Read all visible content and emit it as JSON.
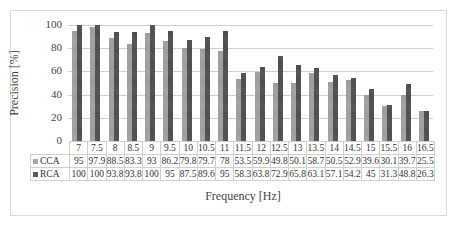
{
  "chart_data": {
    "type": "bar",
    "title": "",
    "xlabel": "Frequency [Hz]",
    "ylabel": "Precision [%]",
    "ylim": [
      0,
      100
    ],
    "yticks": [
      0,
      20,
      40,
      60,
      80,
      100
    ],
    "grid": true,
    "legend_position": "data-table",
    "categories": [
      "7",
      "7.5",
      "8",
      "8.5",
      "9",
      "9.5",
      "10",
      "10.5",
      "11",
      "11.5",
      "12",
      "12.5",
      "13",
      "13.5",
      "14",
      "14.5",
      "15",
      "15.5",
      "16",
      "16.5"
    ],
    "series": [
      {
        "name": "CCA",
        "color": "#a6a6a6",
        "values": [
          95,
          97.9,
          88.5,
          83.3,
          93,
          86.2,
          79.8,
          79.7,
          78,
          53.5,
          59.9,
          49.8,
          50.1,
          58.7,
          50.5,
          52.9,
          39.6,
          30.1,
          39.7,
          25.5
        ]
      },
      {
        "name": "RCA",
        "color": "#595959",
        "values": [
          100,
          100,
          93.8,
          93.8,
          100,
          95,
          87.5,
          89.6,
          95,
          58.3,
          63.8,
          72.9,
          65.8,
          63.1,
          57.1,
          54.2,
          45,
          31.3,
          48.8,
          26.3
        ]
      }
    ]
  }
}
